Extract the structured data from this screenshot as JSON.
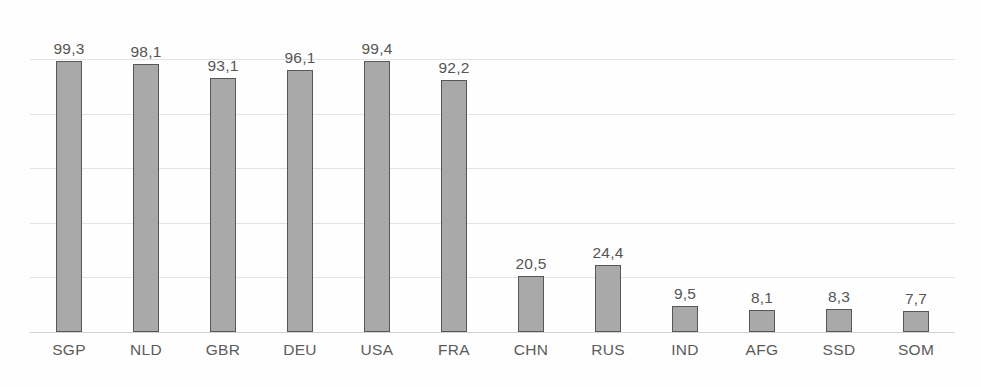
{
  "chart_data": {
    "type": "bar",
    "title": "",
    "subtitle": "",
    "xlabel": "",
    "ylabel": "",
    "categories": [
      "SGP",
      "NLD",
      "GBR",
      "DEU",
      "USA",
      "FRA",
      "CHN",
      "RUS",
      "IND",
      "AFG",
      "SSD",
      "SOM"
    ],
    "values": [
      99.3,
      98.1,
      93.1,
      96.1,
      99.4,
      92.2,
      20.5,
      24.4,
      9.5,
      8.1,
      8.3,
      7.7
    ],
    "value_labels": [
      "99,3",
      "98,1",
      "93,1",
      "96,1",
      "99,4",
      "92,2",
      "20,5",
      "24,4",
      "9,5",
      "8,1",
      "8,3",
      "7,7"
    ],
    "ylim": [
      0,
      100
    ],
    "gridline_values": [
      100,
      80,
      60,
      40,
      20,
      0
    ],
    "ytick_labels": [],
    "grid": true,
    "legend": false,
    "legend_position": "none",
    "annotations": [],
    "colors": {
      "bar_fill": "#a9a9a9",
      "bar_border": "#575757",
      "gridline": "#e3e3e3",
      "baseline": "#d2d2d2",
      "value_label_text": "#555555",
      "category_label_text": "#5b5b5b",
      "background": "#fefefe"
    }
  }
}
